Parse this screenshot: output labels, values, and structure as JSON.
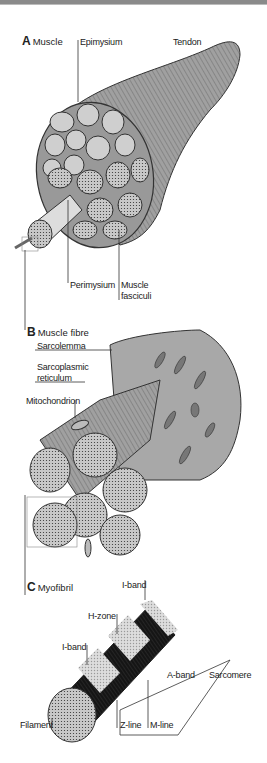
{
  "figure": {
    "panels": [
      {
        "letter": "A",
        "title": "Muscle"
      },
      {
        "letter": "B",
        "title": "Muscle fibre"
      },
      {
        "letter": "C",
        "title": "Myofibril"
      }
    ],
    "labels": {
      "epimysium": "Epimysium",
      "tendon": "Tendon",
      "perimysium": "Perimysium",
      "muscle_fasciculi_1": "Muscle",
      "muscle_fasciculi_2": "fasciculi",
      "sarcolemma": "Sarcolemma",
      "sarcoplasmic_1": "Sarcoplasmic",
      "sarcoplasmic_2": "reticulum",
      "mitochondrion": "Mitochondrion",
      "i_band_top": "I-band",
      "h_zone": "H-zone",
      "i_band_left": "I-band",
      "a_band": "A-band",
      "sarcomere": "Sarcomere",
      "filament": "Filament",
      "z_line": "Z-line",
      "m_line": "M-line"
    }
  },
  "colors": {
    "fill_gray": "#a8a8a8",
    "fill_light": "#d0d0d0",
    "stroke": "#333333",
    "band_dark": "#1a1a1a"
  }
}
